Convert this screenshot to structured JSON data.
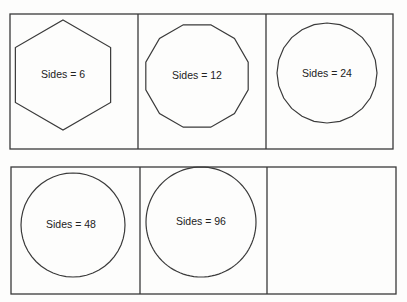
{
  "figure": {
    "stroke_color": "#3a3a3a",
    "background": "#fdfdfc",
    "rows": [
      {
        "panels": [
          {
            "sides": 6,
            "label": "Sides = 6",
            "cx": 63,
            "cy": 75,
            "r": 55,
            "rotation_deg": -90
          },
          {
            "sides": 12,
            "label": "Sides = 12",
            "cx": 197,
            "cy": 76,
            "r": 53,
            "rotation_deg": -75
          },
          {
            "sides": 24,
            "label": "Sides = 24",
            "cx": 327,
            "cy": 73,
            "r": 50,
            "rotation_deg": -90
          }
        ]
      },
      {
        "panels": [
          {
            "sides": 48,
            "label": "Sides = 48",
            "cx": 73,
            "cy": 225,
            "r": 52,
            "rotation_deg": -90
          },
          {
            "sides": 96,
            "label": "Sides = 96",
            "cx": 201,
            "cy": 222,
            "r": 55,
            "rotation_deg": -90
          },
          {
            "sides": null,
            "label": "",
            "empty": true
          }
        ]
      }
    ]
  }
}
